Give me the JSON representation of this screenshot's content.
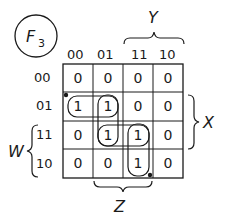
{
  "function_label": {
    "letter": "F",
    "subscript": "3"
  },
  "column_headers": [
    "00",
    "01",
    "11",
    "10"
  ],
  "row_headers": [
    "00",
    "01",
    "11",
    "10"
  ],
  "cells": [
    [
      "0",
      "0",
      "0",
      "0"
    ],
    [
      "1",
      "1",
      "0",
      "0"
    ],
    [
      "0",
      "1",
      "1",
      "0"
    ],
    [
      "0",
      "0",
      "1",
      "0"
    ]
  ],
  "variables": {
    "top": "Y",
    "right": "X",
    "left": "W",
    "bottom": "Z"
  },
  "groupings": [
    {
      "cells": [
        [
          1,
          0
        ],
        [
          1,
          1
        ]
      ],
      "orientation": "horizontal"
    },
    {
      "cells": [
        [
          1,
          1
        ],
        [
          2,
          1
        ]
      ],
      "orientation": "vertical"
    },
    {
      "cells": [
        [
          2,
          1
        ],
        [
          2,
          2
        ]
      ],
      "orientation": "horizontal"
    },
    {
      "cells": [
        [
          2,
          2
        ],
        [
          3,
          2
        ]
      ],
      "orientation": "vertical"
    }
  ],
  "markers": [
    {
      "near_cell": [
        1,
        0
      ],
      "position": "top-left"
    },
    {
      "near_cell": [
        3,
        2
      ],
      "position": "bottom-right"
    }
  ],
  "colors": {
    "ink": "#1a1a1a",
    "background": "#ffffff"
  }
}
